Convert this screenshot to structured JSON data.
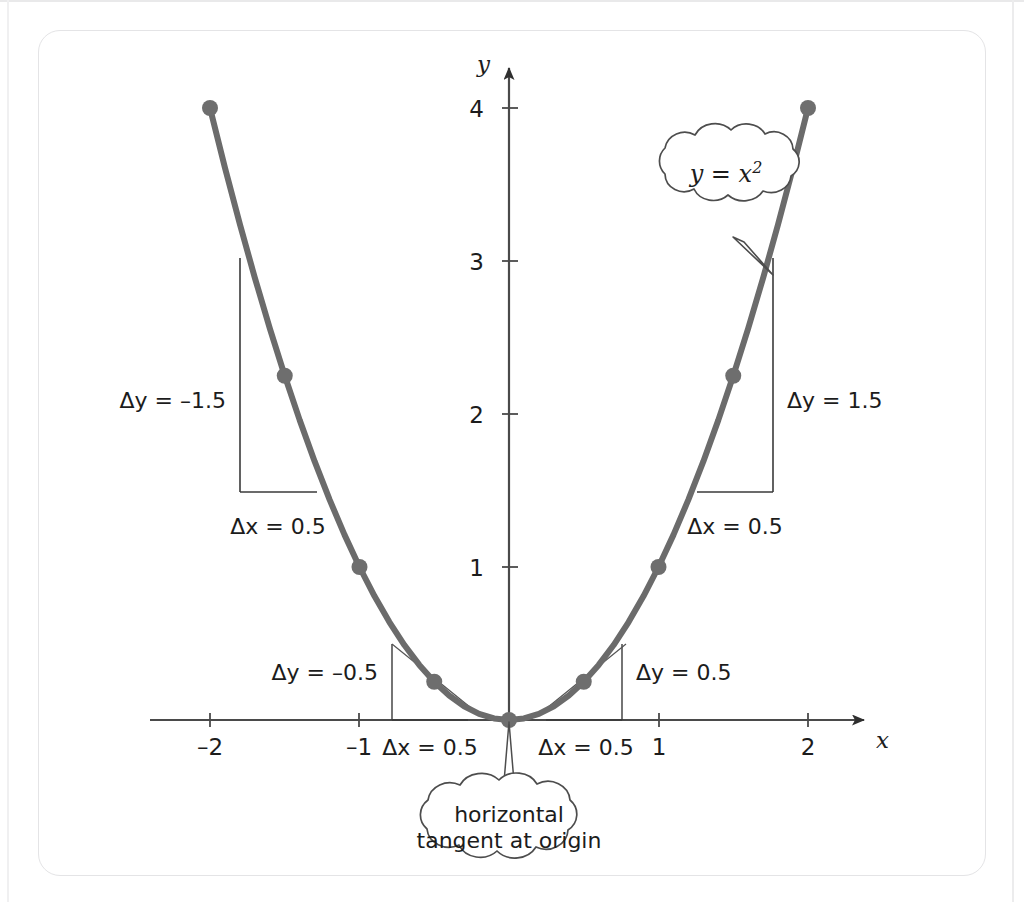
{
  "figure": {
    "colors": {
      "curve": "#6b6b6b",
      "point": "#6e6e6e",
      "axis": "#4a4a4a",
      "triangle": "#3a3a3a",
      "tangent": "#555555",
      "bubble_stroke": "#4d4d4d",
      "text": "#1c1c1c",
      "frame": "#e4e4e6",
      "background": "#ffffff"
    }
  },
  "chart_data": {
    "type": "line",
    "title": "",
    "xlabel": "x",
    "ylabel": "y",
    "xlim": [
      -2.4,
      2.45
    ],
    "ylim": [
      -0.12,
      4.35
    ],
    "grid": false,
    "legend": null,
    "function": "y = x^2",
    "x_ticks": [
      -2,
      -1,
      1,
      2
    ],
    "x_tick_labels": [
      "-2",
      "-1",
      "1",
      "2"
    ],
    "y_ticks": [
      1,
      2,
      3,
      4
    ],
    "y_tick_labels": [
      "1",
      "2",
      "3",
      "4"
    ],
    "series": [
      {
        "name": "y = x^2",
        "x": [
          -2,
          -1.9,
          -1.8,
          -1.7,
          -1.6,
          -1.5,
          -1.4,
          -1.3,
          -1.2,
          -1.1,
          -1,
          -0.9,
          -0.8,
          -0.7,
          -0.6,
          -0.5,
          -0.4,
          -0.3,
          -0.2,
          -0.1,
          0,
          0.1,
          0.2,
          0.3,
          0.4,
          0.5,
          0.6,
          0.7,
          0.8,
          0.9,
          1,
          1.1,
          1.2,
          1.3,
          1.4,
          1.5,
          1.6,
          1.7,
          1.8,
          1.9,
          2
        ],
        "y": [
          4,
          3.61,
          3.24,
          2.89,
          2.56,
          2.25,
          1.96,
          1.69,
          1.44,
          1.21,
          1,
          0.81,
          0.64,
          0.49,
          0.36,
          0.25,
          0.16,
          0.09,
          0.04,
          0.01,
          0,
          0.01,
          0.04,
          0.09,
          0.16,
          0.25,
          0.36,
          0.49,
          0.64,
          0.81,
          1,
          1.21,
          1.44,
          1.69,
          1.96,
          2.25,
          2.56,
          2.89,
          3.24,
          3.61,
          4
        ]
      }
    ],
    "marked_points": [
      {
        "x": -2,
        "y": 4
      },
      {
        "x": -1.5,
        "y": 2.25
      },
      {
        "x": -1,
        "y": 1
      },
      {
        "x": -0.5,
        "y": 0.25
      },
      {
        "x": 0,
        "y": 0
      },
      {
        "x": 0.5,
        "y": 0.25
      },
      {
        "x": 1,
        "y": 1
      },
      {
        "x": 1.5,
        "y": 2.25
      },
      {
        "x": 2,
        "y": 4
      }
    ],
    "difference_triangles": [
      {
        "id": "left-large",
        "x_from": -2,
        "x_to": -1.5,
        "dx": 0.5,
        "dy": -1.5,
        "dx_label": "Δx = 0.5",
        "dy_label": "Δy = –1.5"
      },
      {
        "id": "left-small",
        "x_from": -1,
        "x_to": -0.5,
        "dx": 0.5,
        "dy": -0.5,
        "dx_label": "Δx = 0.5",
        "dy_label": "Δy = –0.5"
      },
      {
        "id": "right-small",
        "x_from": 0.5,
        "x_to": 1,
        "dx": 0.5,
        "dy": 0.5,
        "dx_label": "Δx = 0.5",
        "dy_label": "Δy = 0.5"
      },
      {
        "id": "right-large",
        "x_from": 1.5,
        "x_to": 2,
        "dx": 0.5,
        "dy": 1.5,
        "dx_label": "Δx = 0.5",
        "dy_label": "Δy = 1.5"
      }
    ],
    "annotations": [
      {
        "id": "function-bubble",
        "kind": "thought-cloud",
        "text": "y = x²",
        "text_plain": "y = x",
        "exponent": "2",
        "points_to": {
          "x": 1.72,
          "y": 2.96
        }
      },
      {
        "id": "origin-bubble",
        "kind": "thought-cloud",
        "line1": "horizontal",
        "line2": "tangent at origin",
        "points_to": {
          "x": 0,
          "y": 0
        }
      }
    ],
    "axis_arrow_labels": {
      "x": "x",
      "y": "y"
    }
  },
  "labels": {
    "y_axis": "y",
    "x_axis": "x",
    "y_ticks": [
      "4",
      "3",
      "2",
      "1"
    ],
    "x_ticks": [
      "–2",
      "–1",
      "1",
      "2"
    ],
    "dy_left_large": "Δy = –1.5",
    "dx_left_large": "Δx = 0.5",
    "dy_left_small": "Δy = –0.5",
    "dx_left_small": "Δx = 0.5",
    "dy_right_small": "Δy = 0.5",
    "dx_right_small": "Δx = 0.5",
    "dy_right_large": "Δy = 1.5",
    "dx_right_large": "Δx = 0.5",
    "bubble_function_base": "y = x",
    "bubble_function_exp": "2",
    "bubble_origin_line1": "horizontal",
    "bubble_origin_line2": "tangent at origin"
  }
}
